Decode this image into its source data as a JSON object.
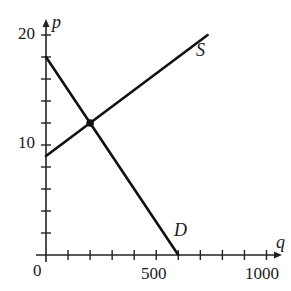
{
  "chart_data": {
    "type": "line",
    "title": "",
    "xlabel": "q",
    "ylabel": "p",
    "xlim": [
      0,
      1000
    ],
    "ylim": [
      0,
      20
    ],
    "grid": false,
    "legend": null,
    "x_ticks": [
      0,
      100,
      200,
      300,
      400,
      500,
      600,
      700,
      800,
      900,
      1000
    ],
    "x_tick_labels": [
      {
        "value": 0,
        "label": "0"
      },
      {
        "value": 500,
        "label": "500"
      },
      {
        "value": 1000,
        "label": "1000"
      }
    ],
    "y_ticks": [
      2,
      4,
      6,
      8,
      10,
      12,
      14,
      16,
      18,
      20
    ],
    "y_tick_labels": [
      {
        "value": 10,
        "label": "10"
      },
      {
        "value": 20,
        "label": "20"
      }
    ],
    "series": [
      {
        "name": "S",
        "label": "S",
        "points": [
          [
            0,
            9
          ],
          [
            733,
            20
          ]
        ]
      },
      {
        "name": "D",
        "label": "D",
        "points": [
          [
            0,
            18
          ],
          [
            600,
            0
          ]
        ]
      }
    ],
    "annotations": [
      {
        "type": "point",
        "description": "equilibrium",
        "x": 200,
        "y": 12
      }
    ]
  },
  "labels": {
    "x_axis": "q",
    "y_axis": "p",
    "origin": "0",
    "x_500": "500",
    "x_1000": "1000",
    "y_10": "10",
    "y_20": "20",
    "supply": "S",
    "demand": "D"
  },
  "colors": {
    "line": "#111111",
    "axis": "#222222"
  }
}
